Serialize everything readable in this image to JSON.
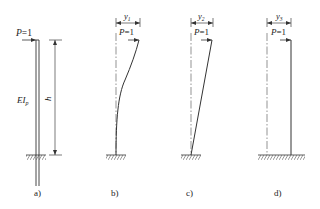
{
  "figure": {
    "panels": [
      {
        "id": "a",
        "caption": "a)",
        "load_label": "P=1",
        "stiffness_label": "EI",
        "stiffness_subscript": "p",
        "height_label": "h"
      },
      {
        "id": "b",
        "caption": "b)",
        "load_label": "P=1",
        "deflection_label": "y",
        "deflection_subscript": "1",
        "shape": "curved (flexural)"
      },
      {
        "id": "c",
        "caption": "c)",
        "load_label": "P=1",
        "deflection_label": "y",
        "deflection_subscript": "2",
        "shape": "straight inclined (rigid rotation)"
      },
      {
        "id": "d",
        "caption": "d)",
        "load_label": "P=1",
        "deflection_label": "y",
        "deflection_subscript": "3",
        "shape": "vertical translated (shear/sliding)"
      }
    ]
  },
  "colors": {
    "line": "#333333",
    "centerline": "#666666",
    "background": "#ffffff"
  }
}
